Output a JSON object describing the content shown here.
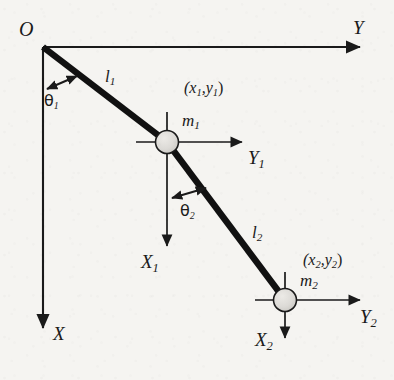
{
  "figure": {
    "background_color": "#f5f4f1",
    "ink_color": "#1a1a1a",
    "bob_fill_color": "#d8d8d4"
  },
  "origin": {
    "label": "O"
  },
  "global_axes": {
    "horizontal": {
      "label": "Y",
      "direction": "right"
    },
    "vertical": {
      "label": "X",
      "direction": "down"
    }
  },
  "links": [
    {
      "label": "l",
      "subscript": "1"
    },
    {
      "label": "l",
      "subscript": "2"
    }
  ],
  "masses": [
    {
      "label": "m",
      "subscript": "1",
      "coordinate_label": "(x₁,y₁)",
      "coord_main": "(x",
      "coord_sub1": "1",
      "coord_mid": ",y",
      "coord_sub2": "1",
      "coord_end": ")",
      "local_axes": {
        "horizontal": {
          "label": "Y",
          "subscript": "1",
          "direction": "right"
        },
        "vertical": {
          "label": "X",
          "subscript": "1",
          "direction": "down"
        }
      }
    },
    {
      "label": "m",
      "subscript": "2",
      "coordinate_label": "(x₂,y₂)",
      "coord_main": "(x",
      "coord_sub1": "2",
      "coord_mid": ",y",
      "coord_sub2": "2",
      "coord_end": ")",
      "local_axes": {
        "horizontal": {
          "label": "Y",
          "subscript": "2",
          "direction": "right"
        },
        "vertical": {
          "label": "X",
          "subscript": "2",
          "direction": "down"
        }
      }
    }
  ],
  "angles": [
    {
      "label": "θ",
      "subscript": "1",
      "measured_from": "X",
      "measured_to": "l1"
    },
    {
      "label": "θ",
      "subscript": "2",
      "measured_from": "X1",
      "measured_to": "l2"
    }
  ],
  "geometry": {
    "origin_px": [
      43,
      47
    ],
    "mass1_px": [
      167,
      142
    ],
    "mass2_px": [
      285,
      300
    ],
    "bob_radius_px": 11,
    "global_y_axis_tip_px": [
      366,
      47
    ],
    "global_x_axis_tip_px": [
      43,
      334
    ],
    "mass1_y_axis_tip_px": [
      248,
      142
    ],
    "mass1_x_axis_tip_px": [
      167,
      252
    ],
    "mass2_y_axis_tip_px": [
      366,
      300
    ],
    "mass2_x_axis_tip_px": [
      285,
      344
    ]
  }
}
